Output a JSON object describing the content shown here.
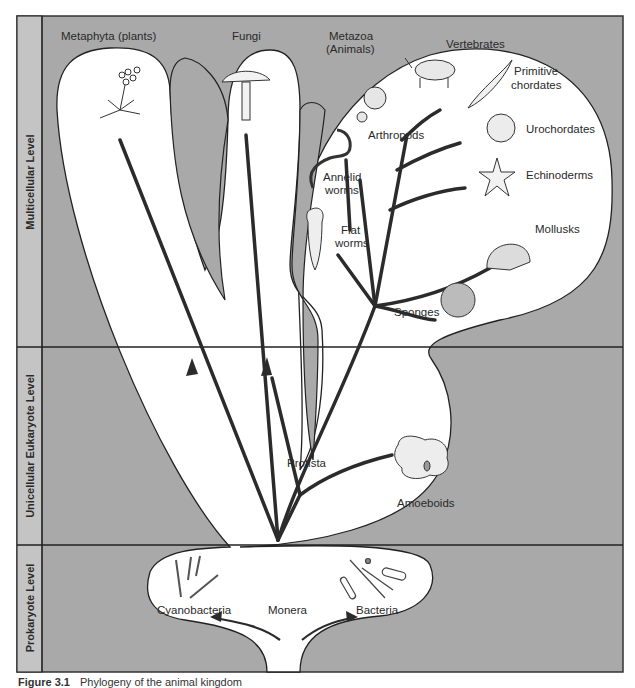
{
  "levels": [
    {
      "label": "Multicellular Level"
    },
    {
      "label": "Unicellular Eukaryote Level"
    },
    {
      "label": "Prokaryote Level"
    }
  ],
  "kingdoms": {
    "plants": "Metaphyta (plants)",
    "fungi": "Fungi",
    "animals_line1": "Metazoa",
    "animals_line2": "(Animals)",
    "protista": "Protista",
    "monera": "Monera"
  },
  "animal_groups": {
    "vertebrates": "Vertebrates",
    "primitive_chordates_1": "Primitive",
    "primitive_chordates_2": "chordates",
    "urochordates": "Urochordates",
    "echinoderms": "Echinoderms",
    "mollusks": "Mollusks",
    "arthropods": "Arthropods",
    "annelid_1": "Annelid",
    "annelid_2": "worms",
    "flat_1": "Flat",
    "flat_2": "worms",
    "sponges": "Sponges"
  },
  "protists": {
    "amoeboids": "Amoeboids"
  },
  "monera_groups": {
    "cyanobacteria": "Cyanobacteria",
    "bacteria": "Bacteria"
  },
  "caption": {
    "number": "Figure 3.1",
    "text": "Phylogeny of the animal kingdom"
  },
  "colors": {
    "background_gray": "#a9a9a9",
    "label_column_gray": "#c4c4c4",
    "region_white": "#ffffff",
    "line_dark": "#2b2b2b"
  }
}
